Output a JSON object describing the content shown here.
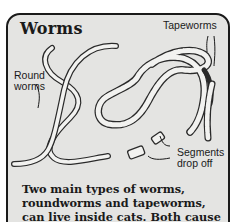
{
  "card": {
    "title": "Worms",
    "labels": {
      "tapeworms": "Tapeworms",
      "roundworms": "Round\nworms",
      "roundworms_line1": "Round",
      "roundworms_line2": "worms",
      "segments_line1": "Segments",
      "segments_line2": "drop off"
    },
    "caption_lines": [
      "Two main types of worms,",
      "roundworms and tapeworms,",
      "can live inside cats. Both cause"
    ]
  },
  "colors": {
    "background": "#ffffff",
    "card_fill": "#e4e4e2",
    "border": "#1a1a1a",
    "worm_fill": "#f2f2f0",
    "worm_outline": "#2a2a2a"
  }
}
